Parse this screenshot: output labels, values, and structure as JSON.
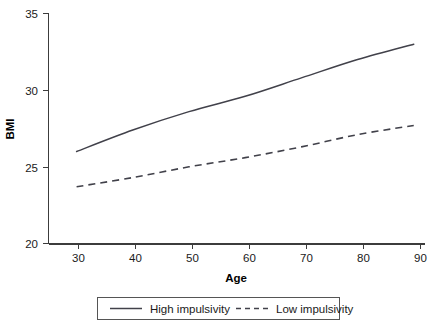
{
  "chart_data": {
    "type": "line",
    "title": "",
    "xlabel": "Age",
    "ylabel": "BMI",
    "xlim": [
      25,
      92
    ],
    "ylim": [
      20,
      35
    ],
    "xticks": [
      30,
      40,
      50,
      60,
      70,
      80,
      90
    ],
    "xticklabels": [
      "30",
      "40",
      "50",
      "60",
      "70",
      "80",
      "90"
    ],
    "yticks": [
      20,
      25,
      30,
      35
    ],
    "yticklabels": [
      "20",
      "25",
      "30",
      "35"
    ],
    "grid": false,
    "legend_position": "bottom-center",
    "x": [
      30,
      40,
      50,
      60,
      70,
      80,
      90
    ],
    "series": [
      {
        "name": "High impulsivity",
        "style": "solid",
        "color": "#41414a",
        "values": [
          26.0,
          27.4,
          28.6,
          29.6,
          30.8,
          32.0,
          33.0
        ]
      },
      {
        "name": "Low impulsivity",
        "style": "dashed",
        "color": "#41414a",
        "values": [
          23.7,
          24.3,
          25.0,
          25.6,
          26.3,
          27.1,
          27.7
        ]
      }
    ]
  },
  "axes": {
    "y_title": "BMI",
    "x_title": "Age",
    "y_tick_labels": [
      "35",
      "30",
      "25",
      "20"
    ],
    "x_tick_labels": [
      "30",
      "40",
      "50",
      "60",
      "70",
      "80",
      "90"
    ]
  },
  "legend": {
    "entries": [
      {
        "label": "High impulsivity",
        "style": "solid"
      },
      {
        "label": "Low impulsivity",
        "style": "dashed"
      }
    ]
  },
  "colors": {
    "line": "#41414a",
    "axis": "#3c3c3c",
    "text": "#1a1a1a",
    "background": "#ffffff"
  }
}
